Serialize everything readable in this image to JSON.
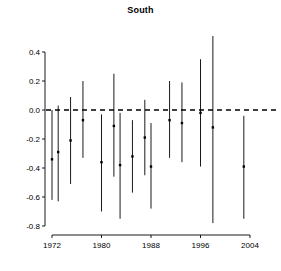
{
  "chart_data": {
    "type": "scatter",
    "title": "South",
    "xlabel": "",
    "ylabel": "",
    "xlim": [
      1970.5,
      2005.5
    ],
    "ylim": [
      -0.8,
      0.45
    ],
    "grid": false,
    "legend": null,
    "reference_line": {
      "y": 0.0,
      "style": "dashed",
      "color": "#000000"
    },
    "xticks": [
      1972,
      1980,
      1988,
      1996,
      2004
    ],
    "xtick_labels": [
      "1972",
      "1980",
      "1988",
      "1996",
      "2004"
    ],
    "yticks": [
      0.4,
      0.2,
      0.0,
      -0.2,
      -0.4,
      -0.6,
      -0.8
    ],
    "ytick_labels": [
      "0.4",
      "0.2",
      "0.0",
      "-0.2",
      "-0.4",
      "-0.6",
      "-0.8"
    ],
    "series": [
      {
        "name": "estimate with confidence interval",
        "marker": "point",
        "color": "#000000",
        "points": [
          {
            "x": 1972,
            "y": -0.34,
            "low": -0.62,
            "high": 0.0
          },
          {
            "x": 1973,
            "y": -0.29,
            "low": -0.63,
            "high": 0.03
          },
          {
            "x": 1975,
            "y": -0.21,
            "low": -0.51,
            "high": 0.09
          },
          {
            "x": 1977,
            "y": -0.07,
            "low": -0.33,
            "high": 0.2
          },
          {
            "x": 1980,
            "y": -0.36,
            "low": -0.7,
            "high": -0.03
          },
          {
            "x": 1982,
            "y": -0.11,
            "low": -0.46,
            "high": 0.25
          },
          {
            "x": 1983,
            "y": -0.38,
            "low": -0.75,
            "high": -0.02
          },
          {
            "x": 1985,
            "y": -0.32,
            "low": -0.57,
            "high": -0.07
          },
          {
            "x": 1987,
            "y": -0.19,
            "low": -0.45,
            "high": 0.07
          },
          {
            "x": 1988,
            "y": -0.39,
            "low": -0.68,
            "high": -0.09
          },
          {
            "x": 1991,
            "y": -0.07,
            "low": -0.33,
            "high": 0.2
          },
          {
            "x": 1993,
            "y": -0.09,
            "low": -0.36,
            "high": 0.19
          },
          {
            "x": 1996,
            "y": -0.02,
            "low": -0.39,
            "high": 0.35
          },
          {
            "x": 1998,
            "y": -0.12,
            "low": -0.78,
            "high": 0.51
          },
          {
            "x": 2003,
            "y": -0.39,
            "low": -0.75,
            "high": -0.04
          }
        ]
      }
    ]
  }
}
